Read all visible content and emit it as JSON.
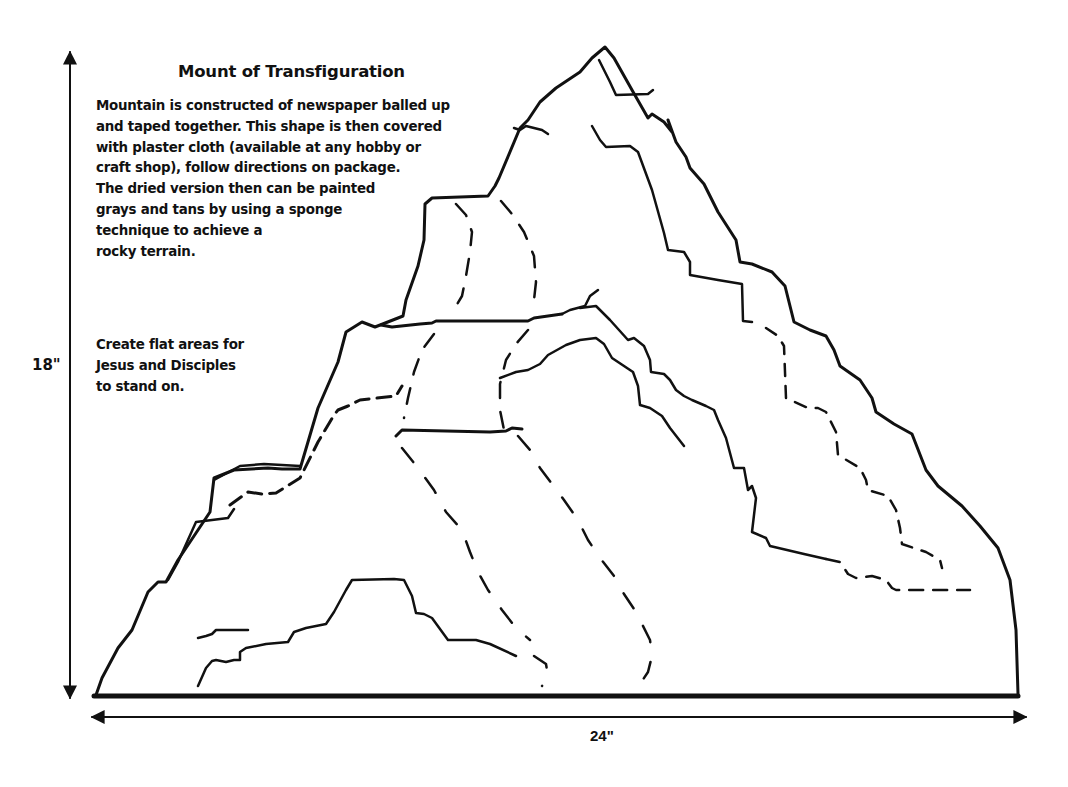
{
  "diagram": {
    "title": "Mount of Transfiguration",
    "description_lines": [
      "Mountain is constructed of newspaper balled up",
      "and taped together. This shape is then covered",
      "with plaster cloth (available at any hobby or",
      "craft shop), follow directions on package.",
      "The dried version then can be painted",
      "grays and tans by using a sponge",
      "technique to achieve a",
      "rocky terrain."
    ],
    "note_lines": [
      "Create flat areas for",
      "Jesus and Disciples",
      "to stand on."
    ],
    "dimensions": {
      "height": "18\"",
      "width": "24\""
    },
    "colors": {
      "ink": "#111111",
      "background": "#ffffff"
    }
  }
}
